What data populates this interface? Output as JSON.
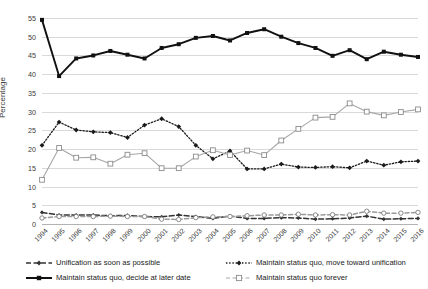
{
  "chart_data": {
    "type": "line",
    "title": "",
    "xlabel": "",
    "ylabel": "Percentage",
    "ylim": [
      0,
      55
    ],
    "ytick_step": 5,
    "grid": true,
    "legend_position": "bottom",
    "categories": [
      "1994",
      "1995",
      "1996",
      "1997",
      "1998",
      "1999",
      "2000",
      "2001",
      "2002",
      "2003",
      "2004",
      "2005",
      "2006",
      "2007",
      "2008",
      "2009",
      "2010",
      "2011",
      "2012",
      "2013",
      "2014",
      "2015",
      "2016"
    ],
    "yticks": [
      "0",
      "5",
      "10",
      "15",
      "20",
      "25",
      "30",
      "35",
      "40",
      "45",
      "50",
      "55"
    ],
    "series": [
      {
        "name": "Unification as soon as possible",
        "style": "dashed",
        "marker": "diamond-small",
        "color": "#333333",
        "values": [
          3.1,
          2.4,
          2.4,
          2.4,
          2.2,
          2.3,
          2.0,
          1.9,
          2.4,
          2.0,
          1.5,
          2.1,
          1.5,
          1.5,
          1.7,
          1.6,
          1.3,
          1.4,
          1.6,
          2.1,
          1.3,
          1.4,
          1.5
        ]
      },
      {
        "name": "Maintain status quo, decide at later date",
        "style": "solid",
        "marker": "square-filled",
        "color": "#111111",
        "values": [
          54.5,
          39.5,
          44.2,
          45.0,
          46.2,
          45.2,
          44.2,
          47.0,
          48.0,
          49.7,
          50.2,
          49.0,
          51.0,
          52.0,
          50.0,
          48.3,
          47.0,
          44.9,
          46.4,
          44.0,
          46.0,
          45.2,
          44.6
        ]
      },
      {
        "name": "Maintain status quo, move toward unification",
        "style": "dotted",
        "marker": "diamond-filled",
        "color": "#1a1a1a",
        "values": [
          21.0,
          27.2,
          25.1,
          24.6,
          24.4,
          23.1,
          26.4,
          28.1,
          26.0,
          21.0,
          17.4,
          19.5,
          14.7,
          14.7,
          16.0,
          15.2,
          15.1,
          15.3,
          15.0,
          16.8,
          15.7,
          16.6,
          16.8
        ]
      },
      {
        "name": "Maintain status quo forever",
        "style": "solid-light",
        "marker": "square-open",
        "color": "#a6a6a6",
        "values": [
          11.8,
          20.3,
          17.7,
          17.8,
          16.1,
          18.5,
          18.9,
          14.9,
          14.9,
          18.0,
          19.7,
          18.4,
          19.6,
          18.4,
          22.3,
          25.4,
          28.4,
          28.6,
          32.2,
          30.0,
          29.0,
          29.9,
          30.6
        ]
      },
      {
        "name": "Independence as soon as possible",
        "style": "dashed-light",
        "marker": "circle-open",
        "color": "#9a9a9a",
        "values": [
          1.6,
          2.0,
          2.0,
          2.0,
          2.1,
          2.0,
          2.0,
          1.3,
          1.2,
          1.7,
          1.9,
          2.0,
          2.2,
          2.4,
          2.4,
          2.6,
          2.4,
          2.5,
          2.4,
          3.4,
          2.9,
          2.9,
          3.1
        ]
      }
    ]
  },
  "legend": {
    "items": [
      {
        "label": "Unification as soon as possible",
        "key": "dashed-diamond"
      },
      {
        "label": "Maintain status quo, decide at later date",
        "key": "solid-square"
      },
      {
        "label": "Maintain status quo, move toward unification",
        "key": "dotted-diamond"
      },
      {
        "label": "Maintain status quo forever",
        "key": "light-square-open"
      }
    ]
  },
  "axis": {
    "y_title": "Percentage"
  }
}
